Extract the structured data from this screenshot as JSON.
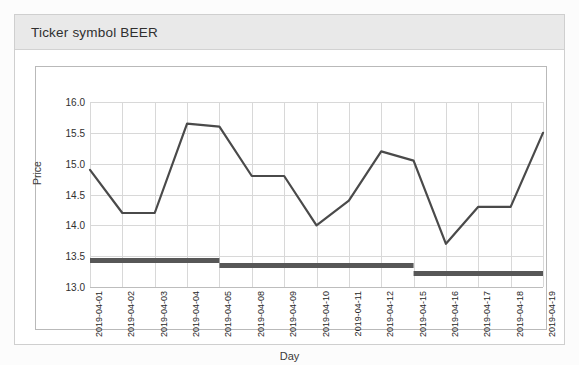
{
  "card": {
    "title": "Ticker symbol BEER"
  },
  "chart_data": {
    "type": "line",
    "title": "Ticker symbol BEER",
    "xlabel": "Day",
    "ylabel": "Price",
    "ylim": [
      13.0,
      16.0
    ],
    "yticks": [
      "13.0",
      "13.5",
      "14.0",
      "14.5",
      "15.0",
      "15.5",
      "16.0"
    ],
    "ytick_values": [
      13.0,
      13.5,
      14.0,
      14.5,
      15.0,
      15.5,
      16.0
    ],
    "grid": true,
    "legend": "none",
    "categories": [
      "2019-04-01",
      "2019-04-02",
      "2019-04-03",
      "2019-04-04",
      "2019-04-05",
      "2019-04-08",
      "2019-04-09",
      "2019-04-10",
      "2019-04-11",
      "2019-04-12",
      "2019-04-15",
      "2019-04-16",
      "2019-04-17",
      "2019-04-18",
      "2019-04-19"
    ],
    "series": [
      {
        "name": "Price",
        "type": "line",
        "color": "#4a4a4a",
        "values": [
          14.9,
          14.2,
          14.2,
          15.65,
          15.6,
          14.8,
          14.8,
          14.0,
          14.4,
          15.2,
          15.05,
          13.7,
          14.3,
          14.3,
          15.5
        ]
      },
      {
        "name": "Step level",
        "type": "step",
        "color": "#575757",
        "values": [
          13.43,
          13.43,
          13.43,
          13.43,
          13.35,
          13.35,
          13.35,
          13.35,
          13.35,
          13.35,
          13.22,
          13.22,
          13.22,
          13.22,
          13.22
        ]
      }
    ]
  },
  "ghost_text": [
    {
      "text": "Table 1.2   Summary query that gathers the commands for",
      "x": 188,
      "y": 22
    },
    {
      "text": "the trends",
      "x": 430,
      "y": 150
    },
    {
      "text": "of the market",
      "x": 408,
      "y": 172
    },
    {
      "text": "in all the weeks",
      "x": 400,
      "y": 194
    },
    {
      "text": "of the year",
      "x": 418,
      "y": 216
    },
    {
      "text": "the ticker symbol",
      "x": 300,
      "y": 300
    },
    {
      "text": "and the price data",
      "x": 290,
      "y": 322
    }
  ]
}
